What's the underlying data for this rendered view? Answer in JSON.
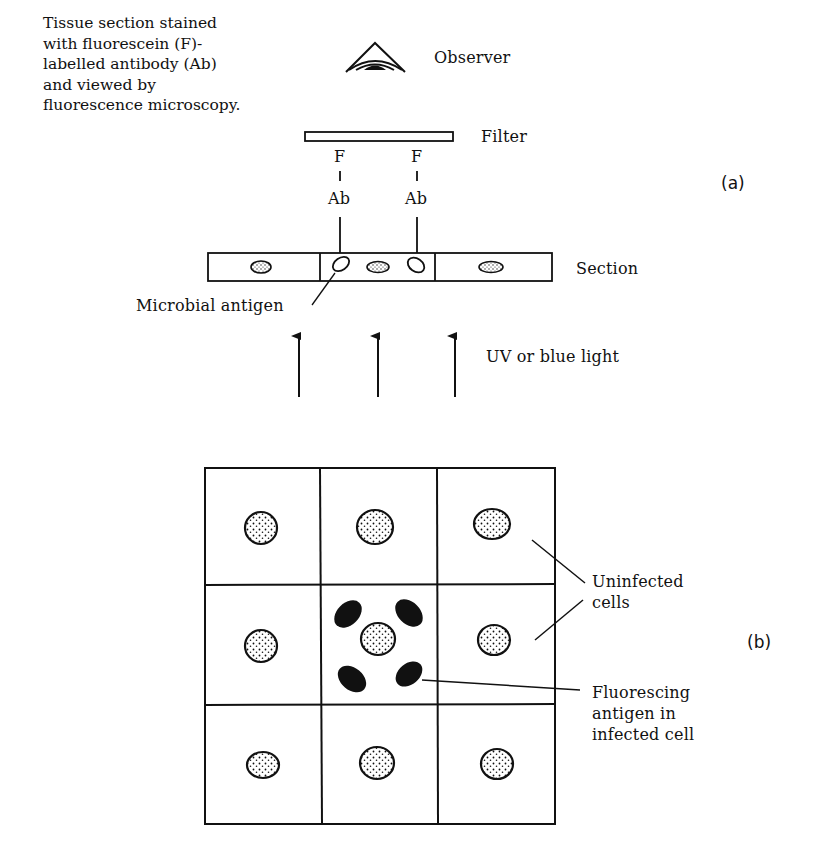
{
  "figure": {
    "panel_a": {
      "tag": "(a)",
      "description_lines": [
        "Tissue section stained",
        "with fluorescein (F)-",
        "labelled antibody (Ab)",
        "and viewed by",
        "fluorescence microscopy."
      ],
      "labels": {
        "observer": "Observer",
        "filter": "Filter",
        "section": "Section",
        "microbial_antigen": "Microbial antigen",
        "light": "UV or blue light",
        "fluorescein": "F",
        "antibody": "Ab"
      },
      "antibody_probes": [
        {
          "x": 340,
          "fluorophore": "F",
          "antibody": "Ab"
        },
        {
          "x": 417,
          "fluorophore": "F",
          "antibody": "Ab"
        }
      ],
      "section_cells": 3,
      "light_arrows": 3
    },
    "panel_b": {
      "tag": "(b)",
      "grid": {
        "rows": 3,
        "cols": 3,
        "infected_cell": {
          "row": 2,
          "col": 2
        }
      },
      "labels": {
        "uninfected": [
          "Uninfected",
          "cells"
        ],
        "fluorescing": [
          "Fluorescing",
          "antigen in",
          "infected cell"
        ]
      }
    },
    "colors": {
      "ink": "#111111",
      "background": "#ffffff"
    }
  }
}
